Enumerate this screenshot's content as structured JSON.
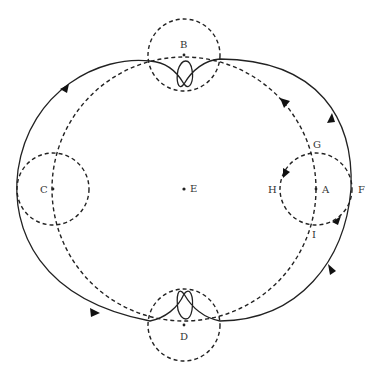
{
  "figure": {
    "type": "geometric orbit diagram",
    "colors": {
      "stroke": "#222222",
      "text": "#333333",
      "background": "#ffffff"
    },
    "center": {
      "label": "E"
    },
    "points": [
      {
        "label": "B",
        "role": "top small circle center"
      },
      {
        "label": "C",
        "role": "left small circle center"
      },
      {
        "label": "D",
        "role": "bottom small circle center"
      },
      {
        "label": "A",
        "role": "right small circle center"
      },
      {
        "label": "E",
        "role": "main circle center"
      },
      {
        "label": "F",
        "role": "rightmost point of solid path"
      },
      {
        "label": "G",
        "role": "upper intersection on right small circle"
      },
      {
        "label": "H",
        "role": "leftmost point of right small circle"
      },
      {
        "label": "I",
        "role": "lower intersection on right small circle"
      }
    ],
    "elements": {
      "main_circle": "dashed circle centered at E",
      "small_circles": "four dashed circles centered at A, B, C, D",
      "solid_path": "solid closed curve with loops at B and D, direction arrows counter-clockwise"
    }
  }
}
